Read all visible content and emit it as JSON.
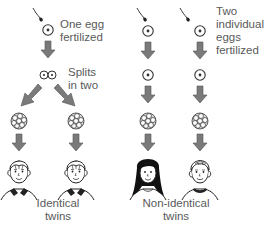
{
  "diagram": {
    "identical": {
      "step1_label_line1": "One egg",
      "step1_label_line2": "fertilized",
      "step2_label_line1": "Splits",
      "step2_label_line2": "in two",
      "result_line1": "Identical",
      "result_line2": "twins"
    },
    "nonidentical": {
      "step1_label_line1": "Two",
      "step1_label_line2": "individual",
      "step1_label_line3": "eggs",
      "step1_label_line4": "fertilized",
      "result_line1": "Non-identical",
      "result_line2": "twins"
    },
    "colors": {
      "arrow_fill": "#7a7a7a",
      "arrow_stroke": "#555555",
      "line": "#222222",
      "text": "#5a5a5a"
    }
  }
}
